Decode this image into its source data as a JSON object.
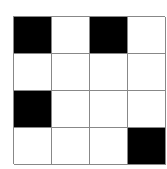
{
  "grid": {
    "rows": 4,
    "cols": 4,
    "fill_color": "#000000",
    "empty_color": "#ffffff",
    "line_color": "#888888",
    "cells": [
      [
        1,
        0,
        1,
        0
      ],
      [
        0,
        0,
        0,
        0
      ],
      [
        1,
        0,
        0,
        0
      ],
      [
        0,
        0,
        0,
        1
      ]
    ]
  }
}
